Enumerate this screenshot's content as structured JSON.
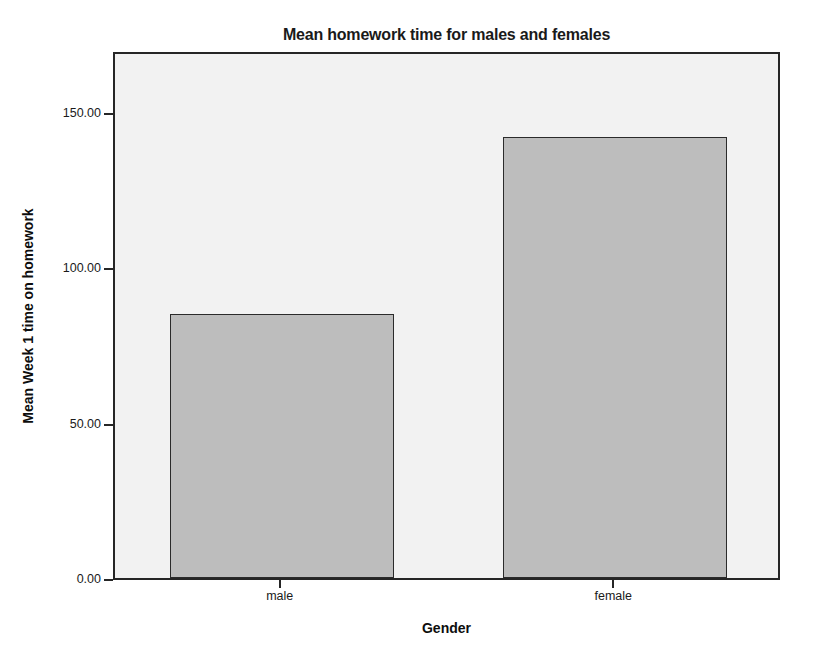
{
  "chart_data": {
    "type": "bar",
    "title": "Mean homework time for males and females",
    "xlabel": "Gender",
    "ylabel": "Mean Week 1 time on homework",
    "categories": [
      "male",
      "female"
    ],
    "values": [
      85,
      142
    ],
    "ylim": [
      0,
      170
    ],
    "yticks": [
      0,
      50,
      100,
      150
    ],
    "ytick_labels": [
      "0.00",
      "50.00",
      "100.00",
      "150.00"
    ],
    "grid": false,
    "legend": "none",
    "bar_fill_color": "#bdbdbd",
    "bar_border_color": "#2b2b2b",
    "plot_background_color": "#f2f2f2",
    "axis_color": "#262626",
    "text_color": "#1a1a1a"
  }
}
